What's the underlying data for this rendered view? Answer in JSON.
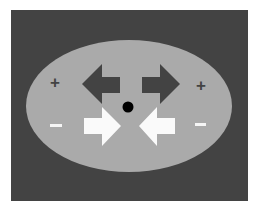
{
  "diagram": {
    "colors": {
      "background": "#ffffff",
      "frame": "#434343",
      "ellipse": "#aaaaaa",
      "dark_arrow": "#434343",
      "light_arrow": "#fafafa",
      "dot": "#000000",
      "plus": "#434343",
      "minus": "#f5f5f5"
    },
    "labels": {
      "left_plus": "+",
      "right_plus": "+",
      "left_minus": "−",
      "right_minus": "−"
    },
    "elements": [
      {
        "name": "frame",
        "shape": "rectangle"
      },
      {
        "name": "ellipse",
        "shape": "ellipse"
      },
      {
        "name": "dark-arrow-left",
        "direction": "left",
        "tone": "dark"
      },
      {
        "name": "dark-arrow-right",
        "direction": "right",
        "tone": "dark"
      },
      {
        "name": "light-arrow-right",
        "direction": "right",
        "tone": "light"
      },
      {
        "name": "light-arrow-left",
        "direction": "left",
        "tone": "light"
      },
      {
        "name": "fixation-dot",
        "shape": "circle"
      }
    ]
  }
}
